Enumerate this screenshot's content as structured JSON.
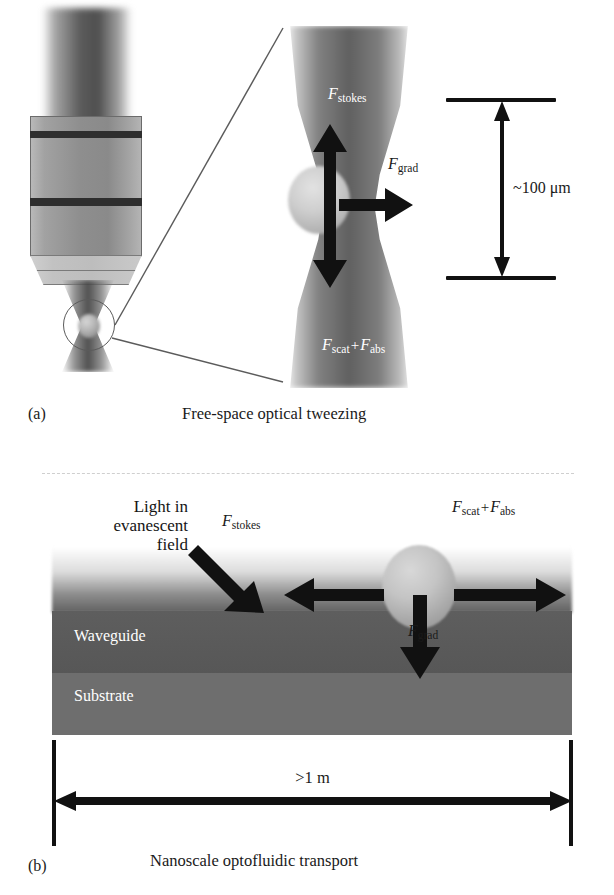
{
  "figure": {
    "panels": [
      {
        "letter": "(a)",
        "caption": "Free-space optical tweezing",
        "scale": {
          "value": "~100 μm"
        },
        "forces": [
          {
            "symbol": "F",
            "subscript": "stokes",
            "direction": "up"
          },
          {
            "symbol": "F",
            "subscript": "grad",
            "direction": "right"
          },
          {
            "symbol": "F",
            "subscript": "scat",
            "subscript2": "abs",
            "operator": "+",
            "direction": "down"
          }
        ],
        "objects": [
          {
            "name": "microscope-objective"
          },
          {
            "name": "focused-laser-beam"
          },
          {
            "name": "trapped-bead"
          },
          {
            "name": "magnification-callout"
          }
        ]
      },
      {
        "letter": "(b)",
        "caption": "Nanoscale optofluidic transport",
        "scale": {
          "value": ">1 m"
        },
        "annotation_light": "Light in\nevanescent\nfield",
        "annotation_light_lines": [
          "Light in",
          "evanescent",
          "field"
        ],
        "layers": [
          {
            "name": "waveguide",
            "label": "Waveguide"
          },
          {
            "name": "substrate",
            "label": "Substrate"
          }
        ],
        "forces": [
          {
            "symbol": "F",
            "subscript": "stokes",
            "direction": "left"
          },
          {
            "symbol": "F",
            "subscript": "scat",
            "subscript2": "abs",
            "operator": "+",
            "direction": "right"
          },
          {
            "symbol": "F",
            "subscript": "grad",
            "direction": "down"
          }
        ]
      }
    ],
    "symbols": {
      "F": "F",
      "plus": "+",
      "sub_stokes": "stokes",
      "sub_grad": "grad",
      "sub_scat": "scat",
      "sub_abs": "abs"
    },
    "colors": {
      "ink": "#1a1a1a",
      "arrow": "#111111",
      "waveguide": "#5a5a5a",
      "substrate": "#6e6e6e",
      "label_on_dark": "#ffffff",
      "dashed_separator": "#cfcfcf"
    }
  }
}
